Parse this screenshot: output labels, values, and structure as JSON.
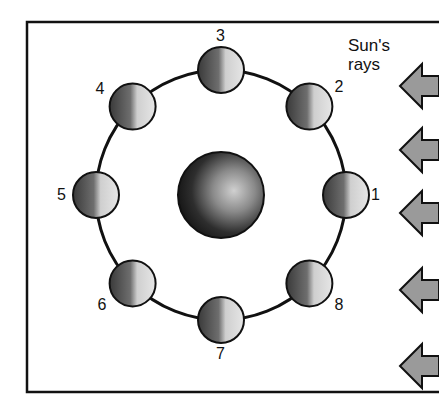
{
  "sun_label_line1": "Sun's",
  "sun_label_line2": "rays",
  "earth": {
    "name": "Earth",
    "cx": 221,
    "cy": 195,
    "r": 43
  },
  "orbit": {
    "cx": 221,
    "cy": 195,
    "r": 125
  },
  "moons": [
    {
      "label": "1",
      "angle_deg": 0
    },
    {
      "label": "2",
      "angle_deg": 45
    },
    {
      "label": "3",
      "angle_deg": 90
    },
    {
      "label": "4",
      "angle_deg": 135
    },
    {
      "label": "5",
      "angle_deg": 180
    },
    {
      "label": "6",
      "angle_deg": 225
    },
    {
      "label": "7",
      "angle_deg": 270
    },
    {
      "label": "8",
      "angle_deg": 315
    }
  ],
  "arrows_count": 5,
  "colors": {
    "border": "#111111",
    "arrow_fill": "#9a9a9a",
    "background": "#ffffff"
  }
}
